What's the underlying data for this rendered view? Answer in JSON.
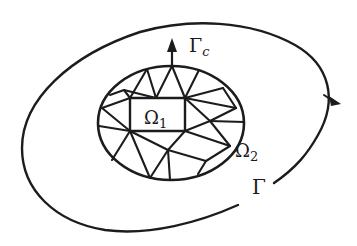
{
  "diagram": {
    "type": "domain-decomposition",
    "labels": {
      "inner_region": {
        "symbol": "Ω",
        "subscript": "1"
      },
      "outer_region": {
        "symbol": "Ω",
        "subscript": "2"
      },
      "interface_boundary": {
        "symbol": "Γ",
        "subscript": "c"
      },
      "outer_boundary": {
        "symbol": "Γ",
        "subscript": ""
      }
    },
    "colors": {
      "ink": "#1c1c1c",
      "background": "#ffffff"
    }
  }
}
